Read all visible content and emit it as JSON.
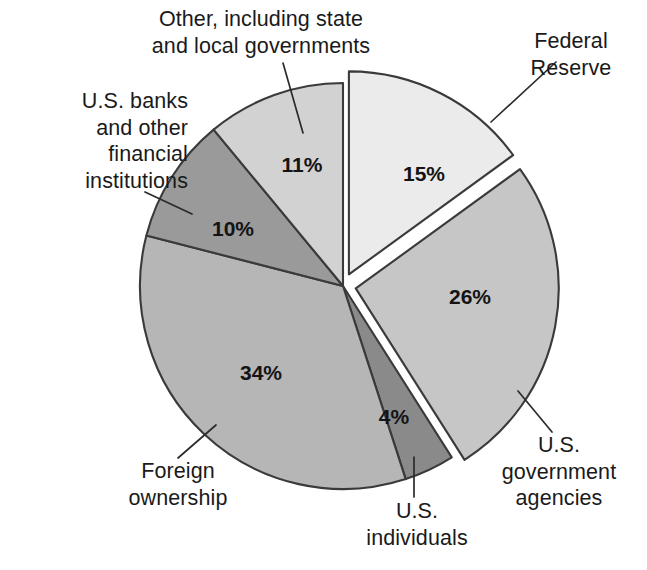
{
  "chart_data": {
    "type": "pie",
    "title": "",
    "subtitle": "",
    "xlabel": "",
    "ylabel": "",
    "legend_position": "none",
    "grid": false,
    "units": "percent",
    "total": 100,
    "exploded_slices": [
      "Federal Reserve",
      "U.S. government agencies"
    ],
    "categories": [
      "Federal Reserve",
      "U.S. government agencies",
      "U.S. individuals",
      "Foreign ownership",
      "U.S. banks and other financial institutions",
      "Other, including state and local governments"
    ],
    "values": [
      15,
      26,
      4,
      34,
      10,
      11
    ],
    "colors": [
      "#ebebeb",
      "#c6c6c6",
      "#8a8a8a",
      "#b6b6b6",
      "#9a9a9a",
      "#d2d2d2"
    ],
    "slices": [
      {
        "label": "Federal Reserve",
        "label_lines": "Federal\nReserve",
        "value": 15,
        "value_text": "15%",
        "color": "#ebebeb",
        "exploded": true
      },
      {
        "label": "U.S. government agencies",
        "label_lines": "U.S.\ngovernment\nagencies",
        "value": 26,
        "value_text": "26%",
        "color": "#c6c6c6",
        "exploded": true
      },
      {
        "label": "U.S. individuals",
        "label_lines": "U.S.\nindividuals",
        "value": 4,
        "value_text": "4%",
        "color": "#8a8a8a",
        "exploded": false
      },
      {
        "label": "Foreign ownership",
        "label_lines": "Foreign\nownership",
        "value": 34,
        "value_text": "34%",
        "color": "#b6b6b6",
        "exploded": false
      },
      {
        "label": "U.S. banks and other financial institutions",
        "label_lines": "U.S. banks\nand other\nfinancial\ninstitutions",
        "value": 10,
        "value_text": "10%",
        "color": "#9a9a9a",
        "exploded": false
      },
      {
        "label": "Other, including state and local governments",
        "label_lines": "Other, including state\nand local governments",
        "value": 11,
        "value_text": "11%",
        "color": "#d2d2d2",
        "exploded": false
      }
    ]
  },
  "style": {
    "background": "#ffffff",
    "outline": "#3a3a3a",
    "text": "#1a1a1a",
    "leader_line": "#2b2b2b"
  }
}
